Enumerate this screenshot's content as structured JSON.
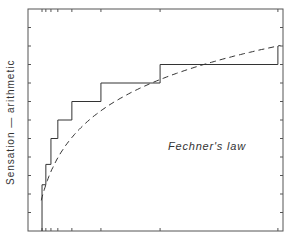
{
  "chart_data": {
    "type": "line",
    "title": "",
    "annotation": "Fechner's law",
    "xlabel": "",
    "ylabel": "Sensation — arithmetic",
    "grid": false,
    "legend": null,
    "ylim": [
      0,
      12
    ],
    "xlim": [
      0,
      1
    ],
    "y_ticks_count": 12,
    "series": [
      {
        "name": "discrimination steps",
        "style": "solid-step",
        "points": [
          [
            0.055,
            0
          ],
          [
            0.055,
            2.5
          ],
          [
            0.07,
            2.5
          ],
          [
            0.07,
            3.6
          ],
          [
            0.09,
            3.6
          ],
          [
            0.09,
            5.0
          ],
          [
            0.117,
            5.0
          ],
          [
            0.117,
            6.0
          ],
          [
            0.172,
            6.0
          ],
          [
            0.172,
            7.0
          ],
          [
            0.286,
            7.0
          ],
          [
            0.286,
            8.0
          ],
          [
            0.518,
            8.0
          ],
          [
            0.518,
            9.0
          ],
          [
            0.98,
            9.0
          ],
          [
            0.98,
            10.0
          ]
        ]
      },
      {
        "name": "logarithmic curve",
        "style": "dashed",
        "equation": "S = k log(I)"
      }
    ],
    "colors": {
      "line": "#333333",
      "frame": "#444444"
    }
  }
}
